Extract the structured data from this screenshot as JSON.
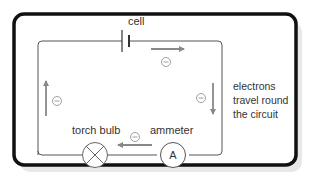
{
  "diagram": {
    "labels": {
      "cell": "cell",
      "torch_bulb": "torch bulb",
      "ammeter": "ammeter",
      "ammeter_symbol": "A",
      "electron_symbol": "−",
      "side_note_line1": "electrons",
      "side_note_line2": "travel round",
      "side_note_line3": "the circuit"
    },
    "components": [
      {
        "type": "cell",
        "name": "cell"
      },
      {
        "type": "lamp",
        "name": "torch bulb"
      },
      {
        "type": "ammeter",
        "name": "ammeter"
      }
    ],
    "electron_flow": [
      "top: left-to-right",
      "right: downward",
      "bottom: right-to-left",
      "left: upward"
    ],
    "colors": {
      "frame": "#111111",
      "wire": "#555555",
      "arrow": "#888888",
      "text": "#333333",
      "shadow": "#e6e6e6"
    }
  }
}
